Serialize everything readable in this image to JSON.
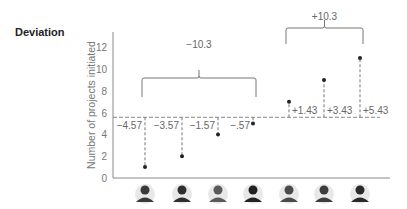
{
  "title": "Deviation",
  "chart_data": {
    "type": "scatter",
    "title": "Deviation",
    "xlabel": "",
    "ylabel": "Number of projects initiated",
    "ylim": [
      0,
      13
    ],
    "yticks": [
      "0",
      "2",
      "4",
      "6",
      "8",
      "10",
      "12"
    ],
    "categories": [
      "Person 1",
      "Person 2",
      "Person 3",
      "Person 4",
      "Person 5",
      "Person 6",
      "Person 7"
    ],
    "values": [
      1,
      2,
      4,
      5,
      7,
      9,
      11
    ],
    "mean": 5.57,
    "deviations": [
      "−4.57",
      "−3.57",
      "−1.57",
      "−.57",
      "+1.43",
      "+3.43",
      "+5.43"
    ],
    "brackets": [
      {
        "label": "−10.3",
        "from": 0,
        "to": 3
      },
      {
        "label": "+10.3",
        "from": 4,
        "to": 6
      }
    ],
    "grid": false
  }
}
